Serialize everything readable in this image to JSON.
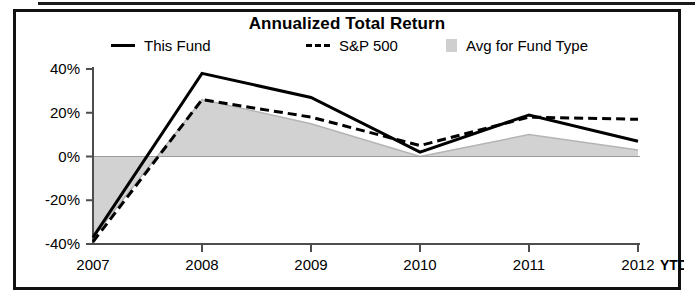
{
  "chart_data": {
    "type": "line",
    "title": "Annualized Total Return",
    "xlabel": "",
    "ylabel": "",
    "grid": false,
    "legend_position": "top",
    "categories": [
      "2007",
      "2008",
      "2009",
      "2010",
      "2011",
      "2012"
    ],
    "x_tick_labels": [
      "2007",
      "2008",
      "2009",
      "2010",
      "2011",
      "2012"
    ],
    "x_axis_suffix": "YTD",
    "y_tick_labels": [
      "40%",
      "20%",
      "0%",
      "-20%",
      "-40%"
    ],
    "y_tick_values": [
      40,
      20,
      0,
      -20,
      -40
    ],
    "ylim": [
      -40,
      40
    ],
    "y_unit": "%",
    "series": [
      {
        "name": "This Fund",
        "style": "solid",
        "color": "#000000",
        "values": [
          -37,
          38,
          27,
          2,
          19,
          7
        ]
      },
      {
        "name": "S&P 500",
        "style": "dashed",
        "color": "#000000",
        "values": [
          -39,
          26,
          18,
          5,
          18,
          17
        ]
      },
      {
        "name": "Avg for Fund Type",
        "style": "area",
        "color": "#d2d2d2",
        "values": [
          -37,
          26,
          15,
          0,
          10,
          3
        ]
      }
    ]
  },
  "chart": {
    "title": "Annualized Total Return",
    "legend": [
      {
        "label": "This Fund",
        "marker": "solid-line-swatch"
      },
      {
        "label": "S&P 500",
        "marker": "dashed-line-swatch"
      },
      {
        "label": "Avg for Fund Type",
        "marker": "area-swatch"
      }
    ],
    "y_axis": {
      "labels": [
        "40%",
        "20%",
        "0%",
        "-20%",
        "-40%"
      ]
    },
    "x_axis": {
      "labels": [
        "2007",
        "2008",
        "2009",
        "2010",
        "2011",
        "2012"
      ],
      "suffix": "YTD"
    }
  }
}
